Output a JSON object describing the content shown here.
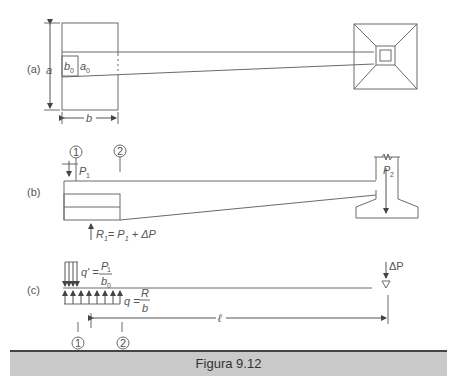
{
  "figure": {
    "caption": "Figura 9.12",
    "panels": {
      "a": {
        "label": "(a)",
        "dim_a": "a",
        "dim_b": "b",
        "col_b0": "b",
        "col_b0_sub": "0",
        "col_a0": "a",
        "col_a0_sub": "0"
      },
      "b": {
        "label": "(b)",
        "section_1": "1",
        "section_2": "2",
        "load_p1": "P",
        "load_p1_sub": "1",
        "load_p2": "P",
        "load_p2_sub": "2",
        "reaction": "R",
        "reaction_sub": "1",
        "reaction_eq": "= P",
        "reaction_eq_sub": "1",
        "reaction_tail": " + ΔP"
      },
      "c": {
        "label": "(c)",
        "q_prime": "q' =",
        "q_prime_num": "P",
        "q_prime_num_sub": "1",
        "q_prime_den": "b",
        "q_prime_den_sub": "0",
        "q": "q =",
        "q_num": "R",
        "q_den": "b",
        "delta_p": "ΔP",
        "span": "ℓ",
        "section_1": "1",
        "section_2": "2"
      }
    }
  }
}
